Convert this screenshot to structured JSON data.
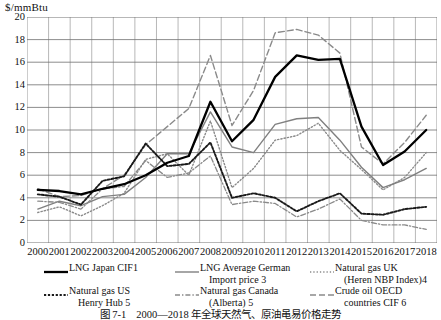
{
  "figure": {
    "y_axis_unit": "$/mmBtu",
    "caption": "图 7-1　2000—2018 年全球天然气、原油黾易价格走势"
  },
  "chart_data": {
    "type": "line",
    "title": "",
    "xlabel": "",
    "ylabel": "$/mmBtu",
    "ylim": [
      0,
      20
    ],
    "yticks": [
      0,
      2,
      4,
      6,
      8,
      10,
      12,
      14,
      16,
      18,
      20
    ],
    "grid": true,
    "legend_position": "below",
    "categories": [
      "2000",
      "2001",
      "2002",
      "2003",
      "2004",
      "2005",
      "2006",
      "2007",
      "2008",
      "2009",
      "2010",
      "2011",
      "2012",
      "2013",
      "2014",
      "2015",
      "2016",
      "2017",
      "2018"
    ],
    "series": [
      {
        "name": "LNG Japan CIF1",
        "style": "solid-thick",
        "color": "#000000",
        "values": [
          4.7,
          4.6,
          4.3,
          4.8,
          5.2,
          6.0,
          7.1,
          7.7,
          12.5,
          9.0,
          10.9,
          14.7,
          16.6,
          16.2,
          16.3,
          10.3,
          6.9,
          8.1,
          10.0
        ]
      },
      {
        "name": "LNG Average German Import price 3",
        "style": "solid-thin",
        "color": "#808080",
        "values": [
          3.0,
          3.7,
          3.3,
          4.1,
          4.3,
          5.8,
          7.9,
          7.9,
          11.6,
          8.5,
          8.0,
          10.5,
          11.0,
          11.1,
          9.1,
          6.7,
          4.9,
          5.6,
          6.6
        ]
      },
      {
        "name": "Natural gas UK (Heren NBP Index)4",
        "style": "dotted",
        "color": "#8a8a8a",
        "values": [
          2.7,
          3.2,
          2.4,
          3.3,
          4.4,
          7.4,
          7.9,
          6.0,
          10.8,
          4.9,
          6.6,
          9.1,
          9.5,
          10.6,
          8.2,
          6.5,
          4.7,
          5.8,
          8.0
        ]
      },
      {
        "name": "Natural gas US Henry Hub 5",
        "style": "dotted-bold",
        "color": "#1a1a1a",
        "values": [
          4.3,
          4.1,
          3.4,
          5.5,
          5.9,
          8.8,
          6.8,
          7.0,
          8.9,
          4.0,
          4.4,
          4.0,
          2.8,
          3.7,
          4.4,
          2.6,
          2.5,
          3.0,
          3.2
        ]
      },
      {
        "name": "Natural gas Canada (Alberta) 5",
        "style": "dash-dot",
        "color": "#8a8a8a",
        "values": [
          3.7,
          3.6,
          3.0,
          4.8,
          5.0,
          7.3,
          5.8,
          6.2,
          7.7,
          3.4,
          3.7,
          3.5,
          2.3,
          3.0,
          3.9,
          2.0,
          1.6,
          1.6,
          1.2
        ]
      },
      {
        "name": "Crude oil OECD countries CIF 6",
        "style": "dashed",
        "color": "#8a8a8a",
        "values": [
          4.8,
          4.1,
          4.2,
          4.8,
          6.0,
          8.7,
          10.3,
          11.9,
          16.6,
          10.4,
          13.5,
          18.6,
          18.9,
          18.4,
          16.8,
          8.5,
          7.0,
          8.9,
          11.3
        ]
      }
    ]
  },
  "legend": {
    "items": [
      {
        "id": "lng-japan-cif",
        "line1": "LNG Japan CIF1",
        "line2": "",
        "style": "solid-thick"
      },
      {
        "id": "lng-german-import",
        "line1": "LNG Average German",
        "line2": "Import price 3",
        "style": "solid-thin"
      },
      {
        "id": "gas-uk-nbp",
        "line1": "Natural gas UK",
        "line2": "(Heren NBP Index)4",
        "style": "dotted"
      },
      {
        "id": "gas-us-henry-hub",
        "line1": "Natural gas US",
        "line2": "Henry Hub 5",
        "style": "dotted-bold"
      },
      {
        "id": "gas-canada-alberta",
        "line1": "Natural gas Canada",
        "line2": "(Alberta) 5",
        "style": "dash-dot"
      },
      {
        "id": "crude-oil-oecd",
        "line1": "Crude oil OECD",
        "line2": "countries CIF 6",
        "style": "dashed"
      }
    ]
  }
}
